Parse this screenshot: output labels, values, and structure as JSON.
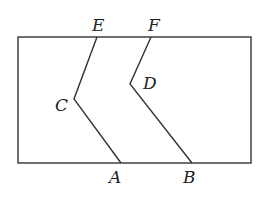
{
  "diagram": {
    "type": "geometry",
    "rectangle": {
      "x1": 18,
      "y1": 37,
      "x2": 251,
      "y2": 163
    },
    "points": {
      "E": {
        "label": "E",
        "x": 97,
        "y": 37
      },
      "F": {
        "label": "F",
        "x": 151,
        "y": 37
      },
      "C": {
        "label": "C",
        "x": 74,
        "y": 99
      },
      "D": {
        "label": "D",
        "x": 130,
        "y": 84
      },
      "A": {
        "label": "A",
        "x": 121,
        "y": 163
      },
      "B": {
        "label": "B",
        "x": 192,
        "y": 163
      }
    },
    "segments": [
      [
        "E",
        "C"
      ],
      [
        "C",
        "A"
      ],
      [
        "F",
        "D"
      ],
      [
        "D",
        "B"
      ]
    ],
    "color": "#333333"
  }
}
